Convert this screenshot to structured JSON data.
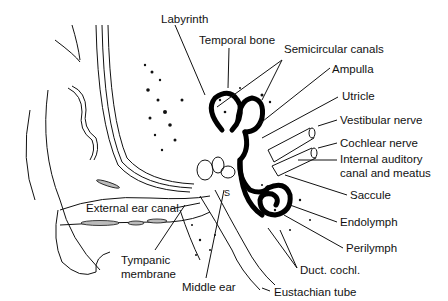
{
  "diagram": {
    "labels": [
      {
        "id": "labyrinth",
        "text": "Labyrinth",
        "x": 161,
        "y": 13
      },
      {
        "id": "temporal-bone",
        "text": "Temporal bone",
        "x": 199,
        "y": 34
      },
      {
        "id": "semicircular-canals",
        "text": "Semicircular canals",
        "x": 284,
        "y": 43
      },
      {
        "id": "ampulla",
        "text": "Ampulla",
        "x": 332,
        "y": 63
      },
      {
        "id": "utricle",
        "text": "Utricle",
        "x": 342,
        "y": 90
      },
      {
        "id": "vestibular-nerve",
        "text": "Vestibular nerve",
        "x": 340,
        "y": 114
      },
      {
        "id": "cochlear-nerve",
        "text": "Cochlear nerve",
        "x": 340,
        "y": 137
      },
      {
        "id": "internal-auditory-canal",
        "text": "Internal auditory",
        "x": 340,
        "y": 153
      },
      {
        "id": "internal-auditory-canal-2",
        "text": "canal and meatus",
        "x": 340,
        "y": 167
      },
      {
        "id": "saccule",
        "text": "Saccule",
        "x": 350,
        "y": 189
      },
      {
        "id": "endolymph",
        "text": "Endolymph",
        "x": 340,
        "y": 216
      },
      {
        "id": "perilymph",
        "text": "Perilymph",
        "x": 346,
        "y": 242
      },
      {
        "id": "duct-cochl",
        "text": "Duct. cochl.",
        "x": 300,
        "y": 264
      },
      {
        "id": "eustachian-tube",
        "text": "Eustachian tube",
        "x": 274,
        "y": 286
      },
      {
        "id": "external-ear-canal",
        "text": "External ear canal",
        "x": 86,
        "y": 202
      },
      {
        "id": "tympanic-membrane",
        "text": "Tympanic",
        "x": 121,
        "y": 254
      },
      {
        "id": "tympanic-membrane-2",
        "text": "membrane",
        "x": 121,
        "y": 268
      },
      {
        "id": "middle-ear",
        "text": "Middle ear",
        "x": 182,
        "y": 281
      }
    ],
    "inline_marks": {
      "s_label": "S"
    }
  }
}
